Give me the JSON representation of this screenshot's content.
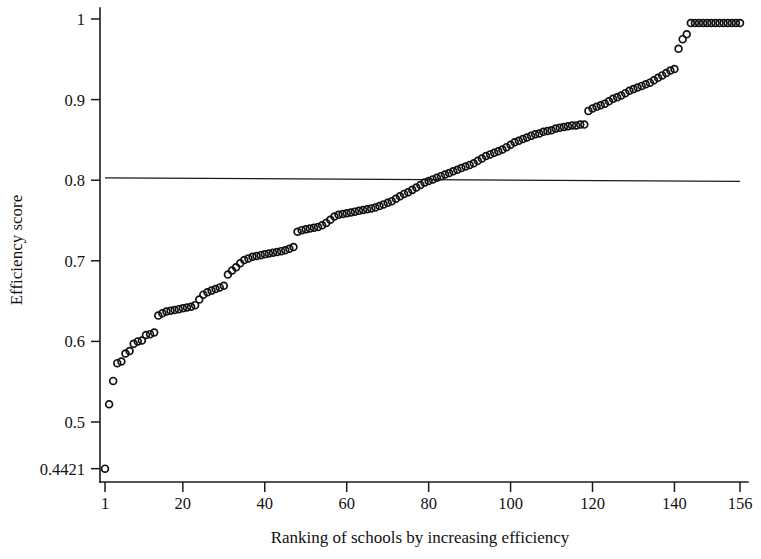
{
  "chart_data": {
    "type": "scatter",
    "title": "",
    "xlabel": "Ranking of schools by increasing efficiency",
    "ylabel": "Efficiency score",
    "xlim": [
      1,
      156
    ],
    "ylim": [
      0.4421,
      1.0
    ],
    "grid": false,
    "legend": null,
    "marker": "open-circle",
    "xticks": [
      1,
      20,
      40,
      60,
      80,
      100,
      120,
      140,
      156
    ],
    "xticklabels": [
      "1",
      "20",
      "40",
      "60",
      "80",
      "100",
      "120",
      "140",
      "156"
    ],
    "yticks": [
      0.4421,
      0.5,
      0.6,
      0.7,
      0.8,
      0.9,
      1.0
    ],
    "yticklabels": [
      "0.4421",
      "0.5",
      "0.6",
      "0.7",
      "0.8",
      "0.9",
      "1"
    ],
    "annotations": [
      {
        "name": "mean-efficiency-reference-line",
        "type": "horizontal-line",
        "y_start": 0.803,
        "y_end": 0.7985,
        "x_start": 1,
        "x_end": 156,
        "label": ""
      }
    ],
    "series": [
      {
        "name": "Efficiency score by rank",
        "x": [
          1,
          2,
          3,
          4,
          5,
          6,
          7,
          8,
          9,
          10,
          11,
          12,
          13,
          14,
          15,
          16,
          17,
          18,
          19,
          20,
          21,
          22,
          23,
          24,
          25,
          26,
          27,
          28,
          29,
          30,
          31,
          32,
          33,
          34,
          35,
          36,
          37,
          38,
          39,
          40,
          41,
          42,
          43,
          44,
          45,
          46,
          47,
          48,
          49,
          50,
          51,
          52,
          53,
          54,
          55,
          56,
          57,
          58,
          59,
          60,
          61,
          62,
          63,
          64,
          65,
          66,
          67,
          68,
          69,
          70,
          71,
          72,
          73,
          74,
          75,
          76,
          77,
          78,
          79,
          80,
          81,
          82,
          83,
          84,
          85,
          86,
          87,
          88,
          89,
          90,
          91,
          92,
          93,
          94,
          95,
          96,
          97,
          98,
          99,
          100,
          101,
          102,
          103,
          104,
          105,
          106,
          107,
          108,
          109,
          110,
          111,
          112,
          113,
          114,
          115,
          116,
          117,
          118,
          119,
          120,
          121,
          122,
          123,
          124,
          125,
          126,
          127,
          128,
          129,
          130,
          131,
          132,
          133,
          134,
          135,
          136,
          137,
          138,
          139,
          140,
          141,
          142,
          143,
          144,
          145,
          146,
          147,
          148,
          149,
          150,
          151,
          152,
          153,
          154,
          155,
          156
        ],
        "values": [
          0.4421,
          0.522,
          0.551,
          0.573,
          0.575,
          0.585,
          0.588,
          0.597,
          0.6,
          0.601,
          0.608,
          0.609,
          0.611,
          0.632,
          0.635,
          0.637,
          0.638,
          0.639,
          0.64,
          0.641,
          0.642,
          0.643,
          0.645,
          0.652,
          0.658,
          0.661,
          0.663,
          0.665,
          0.667,
          0.669,
          0.683,
          0.688,
          0.692,
          0.697,
          0.701,
          0.703,
          0.705,
          0.706,
          0.707,
          0.708,
          0.709,
          0.71,
          0.711,
          0.712,
          0.713,
          0.715,
          0.717,
          0.736,
          0.738,
          0.739,
          0.74,
          0.741,
          0.742,
          0.744,
          0.747,
          0.751,
          0.755,
          0.757,
          0.758,
          0.759,
          0.76,
          0.761,
          0.762,
          0.763,
          0.764,
          0.765,
          0.766,
          0.768,
          0.77,
          0.772,
          0.774,
          0.777,
          0.78,
          0.783,
          0.785,
          0.788,
          0.791,
          0.794,
          0.797,
          0.799,
          0.801,
          0.803,
          0.805,
          0.807,
          0.809,
          0.811,
          0.813,
          0.815,
          0.817,
          0.819,
          0.821,
          0.824,
          0.827,
          0.83,
          0.832,
          0.834,
          0.836,
          0.838,
          0.841,
          0.844,
          0.847,
          0.849,
          0.851,
          0.853,
          0.855,
          0.857,
          0.858,
          0.86,
          0.861,
          0.862,
          0.864,
          0.865,
          0.866,
          0.867,
          0.868,
          0.868,
          0.869,
          0.869,
          0.886,
          0.889,
          0.891,
          0.893,
          0.895,
          0.898,
          0.901,
          0.903,
          0.905,
          0.908,
          0.911,
          0.913,
          0.915,
          0.917,
          0.919,
          0.921,
          0.924,
          0.927,
          0.93,
          0.933,
          0.936,
          0.938,
          0.963,
          0.975,
          0.981,
          0.995,
          0.995,
          0.995,
          0.995,
          0.995,
          0.995,
          0.995,
          0.995,
          0.995,
          0.995,
          0.995,
          0.995,
          0.995
        ]
      }
    ]
  },
  "figure": {
    "background_color": "#ffffff",
    "axis_color": "#1a1a1a",
    "marker_color": "#111111"
  }
}
